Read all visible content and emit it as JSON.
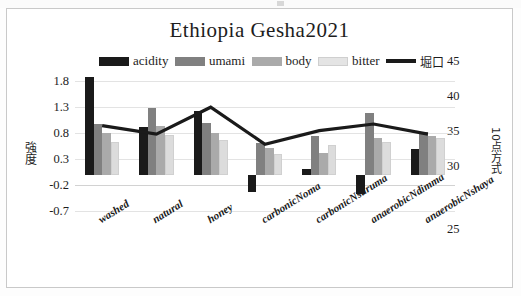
{
  "chart_data": {
    "type": "bar",
    "title": "Ethiopia  Gesha2021",
    "categories": [
      "washed",
      "natural",
      "honey",
      "carbonicNoma",
      "carbonicNsuruma",
      "anaerobicNdimma",
      "anaerobicNshaya"
    ],
    "series": [
      {
        "name": "acidity",
        "color": "#1a1a1a",
        "axis": "left",
        "values": [
          1.87,
          0.92,
          1.22,
          -0.33,
          0.1,
          -0.38,
          0.5
        ]
      },
      {
        "name": "umami",
        "color": "#808080",
        "axis": "left",
        "values": [
          0.98,
          1.28,
          1.0,
          0.6,
          0.75,
          1.18,
          0.82
        ]
      },
      {
        "name": "body",
        "color": "#aaaaaa",
        "axis": "left",
        "values": [
          0.8,
          0.93,
          0.8,
          0.52,
          0.42,
          0.7,
          0.74
        ]
      },
      {
        "name": "bitter",
        "color": "#dcdcdc",
        "axis": "left",
        "values": [
          0.62,
          0.77,
          0.66,
          0.4,
          0.57,
          0.63,
          0.7
        ]
      }
    ],
    "line_series": {
      "name": "堀口",
      "color": "#1a1a1a",
      "axis": "right",
      "values": [
        37.3,
        36.3,
        39.5,
        35.1,
        36.7,
        37.5,
        36.3
      ]
    },
    "left_axis": {
      "label": "強度",
      "ticks": [
        "1.8",
        "1.3",
        "0.8",
        "0.3",
        "-0.2",
        "-0.7"
      ],
      "min": -0.7,
      "max": 1.8
    },
    "right_axis": {
      "label": "10点方式",
      "ticks": [
        "45",
        "40",
        "35",
        "30",
        "25"
      ],
      "min": 25,
      "max": 45
    },
    "legend": [
      {
        "label": "acidity",
        "type": "swatch",
        "color": "#1a1a1a"
      },
      {
        "label": "umami",
        "type": "swatch",
        "color": "#808080"
      },
      {
        "label": "body",
        "type": "swatch",
        "color": "#aaaaaa"
      },
      {
        "label": "bitter",
        "type": "swatch",
        "color": "#dcdcdc"
      },
      {
        "label": "堀口",
        "type": "line",
        "color": "#1a1a1a"
      }
    ],
    "grid": true,
    "legend_position": "top"
  }
}
